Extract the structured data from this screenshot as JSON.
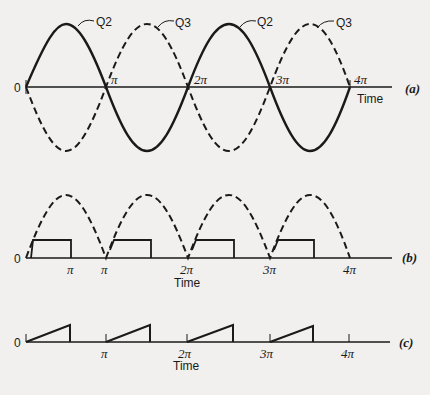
{
  "diagram": {
    "colors": {
      "ink": "#1a1a1a",
      "paper": "#f1f0ee"
    },
    "panel_a": {
      "label": "(a)",
      "origin_label": "0",
      "axis_label": "Time",
      "tick_labels": [
        "π",
        "2π",
        "3π",
        "4π"
      ],
      "curve_labels": [
        "Q2",
        "Q3",
        "Q2",
        "Q3"
      ],
      "series": [
        {
          "name": "Q2",
          "style": "solid",
          "description": "sine wave starting positive at 0"
        },
        {
          "name": "Q3",
          "style": "dashed",
          "description": "inverted sine wave starting negative at 0"
        }
      ]
    },
    "panel_b": {
      "label": "(b)",
      "origin_label": "0",
      "axis_label": "Time",
      "tick_labels": [
        "π",
        "π",
        "2π",
        "3π",
        "4π"
      ],
      "description": "dashed rectified half-sine arches with solid rectangular pulses beginning at each multiple of π"
    },
    "panel_c": {
      "label": "(c)",
      "origin_label": "0",
      "axis_label": "Time",
      "tick_labels": [
        "π",
        "2π",
        "3π",
        "4π"
      ],
      "description": "solid sawtooth ramps starting at each multiple of π"
    }
  }
}
